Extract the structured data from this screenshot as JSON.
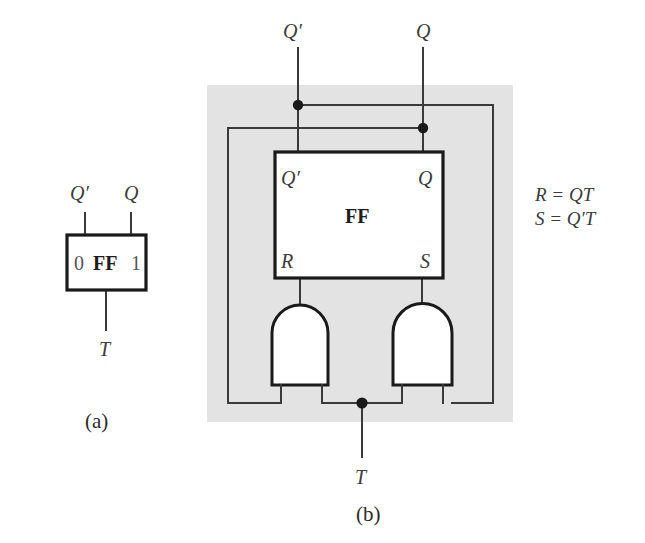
{
  "figure": {
    "caption_a": "(a)",
    "caption_b": "(b)",
    "panel_a": {
      "block_label": "FF",
      "input_label_bottom": "T",
      "output_label_left": "Q′",
      "output_label_right": "Q",
      "pin_left_digit": "0",
      "pin_right_digit": "1"
    },
    "panel_b": {
      "block_label": "FF",
      "block_pin_top_left": "Q′",
      "block_pin_top_right": "Q",
      "block_pin_bottom_left": "R",
      "block_pin_bottom_right": "S",
      "external_label_left": "Q′",
      "external_label_right": "Q",
      "input_label_bottom": "T",
      "gate_left_name": "and-gate",
      "gate_right_name": "and-gate",
      "shade_color": "#e3e3e3"
    },
    "equations": {
      "line1": "R = QT",
      "line2": "S = Q′T"
    }
  }
}
